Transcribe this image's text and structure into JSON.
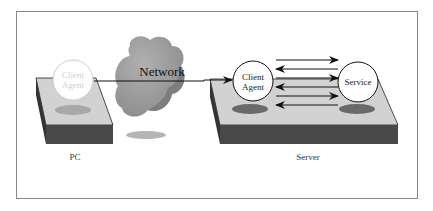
{
  "diagram": {
    "nodes": {
      "pc_agent": "Client\nAgent",
      "server_agent": "Client\nAgent",
      "service": "Service",
      "network": "Network"
    },
    "labels": {
      "pc": "PC",
      "server": "Server"
    },
    "arrows": [
      {
        "from": "server_agent",
        "to": "service"
      },
      {
        "from": "service",
        "to": "server_agent"
      },
      {
        "from": "server_agent",
        "to": "service"
      },
      {
        "from": "service",
        "to": "server_agent"
      },
      {
        "from": "server_agent",
        "to": "service"
      },
      {
        "from": "service",
        "to": "server_agent"
      }
    ],
    "connection": {
      "from": "pc_agent",
      "to": "server_agent",
      "via": "network"
    },
    "colors": {
      "platform_top": "#d4d4d4",
      "platform_side": "#4a4a4a",
      "cloud": "#9a9a9a",
      "shadow": "#8a8a8a",
      "stroke": "#111111"
    }
  }
}
